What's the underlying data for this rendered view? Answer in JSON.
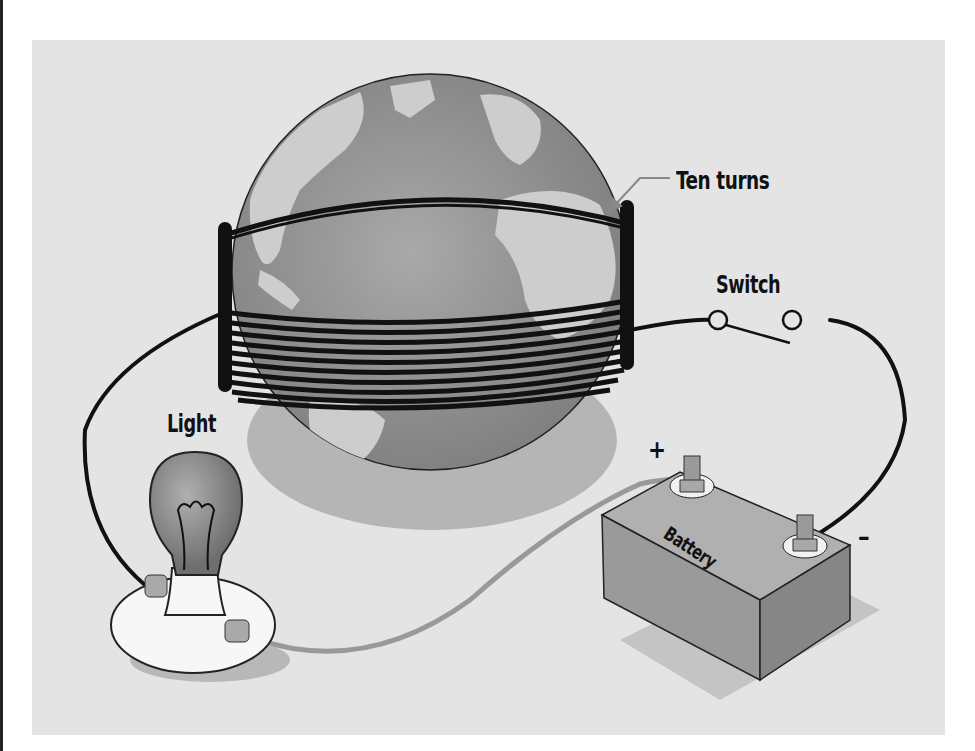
{
  "diagram": {
    "labels": {
      "coil": "Ten turns",
      "switch": "Switch",
      "light": "Light",
      "battery": "Battery",
      "positive_terminal": "+",
      "negative_terminal": "–"
    },
    "components": [
      "globe",
      "wire-coil",
      "switch",
      "light-bulb",
      "battery"
    ],
    "coil_turns": 10,
    "colors": {
      "background": "#e4e4e4",
      "wire": "#111111",
      "globe_ocean": "#8f8f8f",
      "globe_land": "#c9c9c9",
      "battery_body": "#a8a8a8",
      "bulb": "#8a8a8a",
      "socket": "#f5f5f5",
      "return_wire": "#999999"
    }
  }
}
